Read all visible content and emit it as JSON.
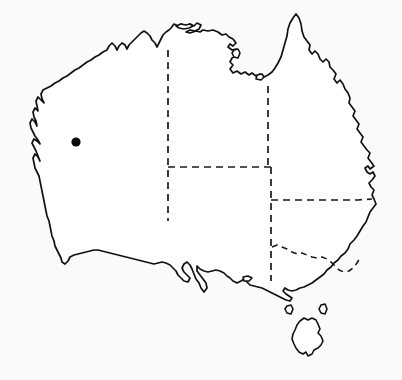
{
  "figure": {
    "kind": "locality-map",
    "region_depicted": "Australia",
    "caption": "",
    "background_color": "#fafafa",
    "outline_color": "#111111",
    "border_color": "#1a1a1a",
    "marker_color": "#0b0b0b",
    "width_px": 402,
    "height_px": 380
  },
  "markers": [
    {
      "name": "locality-point",
      "label": "",
      "x": 76,
      "y": 142,
      "radius": 4.6,
      "color": "#0b0b0b"
    }
  ],
  "internal_borders": [
    {
      "name": "wa-nt-sa-vertical-border",
      "style": "dashed"
    },
    {
      "name": "nt-qld-vertical-border",
      "style": "dashed"
    },
    {
      "name": "sa-northern-border",
      "style": "dashed"
    },
    {
      "name": "sa-nsw-vertical-border",
      "style": "dashed"
    },
    {
      "name": "qld-nsw-border",
      "style": "dashed"
    },
    {
      "name": "nsw-vic-border",
      "style": "dashed"
    }
  ],
  "landmasses": [
    {
      "name": "mainland-australia"
    },
    {
      "name": "tasmania"
    },
    {
      "name": "king-island"
    },
    {
      "name": "flinders-island"
    },
    {
      "name": "groote-eylandt"
    },
    {
      "name": "melville-island"
    },
    {
      "name": "mornington-island"
    },
    {
      "name": "kangaroo-island"
    }
  ]
}
